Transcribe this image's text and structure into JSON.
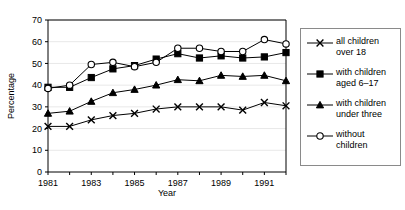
{
  "chart_data": {
    "type": "line",
    "title": "",
    "xlabel": "Year",
    "ylabel": "Percentage",
    "x": [
      1981,
      1982,
      1983,
      1984,
      1985,
      1986,
      1987,
      1988,
      1989,
      1990,
      1991,
      1992
    ],
    "xticklabels": [
      "1981",
      "",
      "1983",
      "",
      "1985",
      "",
      "1987",
      "",
      "1989",
      "",
      "1991",
      ""
    ],
    "yticks": [
      0,
      10,
      20,
      30,
      40,
      50,
      60,
      70
    ],
    "yticklabels": [
      "0",
      "10",
      "20",
      "30",
      "40",
      "50",
      "60",
      "70"
    ],
    "xlim": [
      1981,
      1992
    ],
    "ylim": [
      0,
      70
    ],
    "grid": false,
    "legend_position": "right-outside",
    "series": [
      {
        "name": "all children over 18",
        "marker": "x",
        "values": [
          21,
          21,
          24,
          26,
          27,
          29,
          30,
          30,
          30,
          28.5,
          32,
          30.5
        ]
      },
      {
        "name": "with children aged 6–17",
        "marker": "filled-square",
        "values": [
          39,
          39,
          43.5,
          47.5,
          49,
          52,
          54.5,
          52.5,
          53.5,
          52.5,
          53,
          55
        ]
      },
      {
        "name": "with children under three",
        "marker": "filled-triangle",
        "values": [
          27,
          28,
          32.5,
          36.5,
          38,
          40,
          42.5,
          42,
          44.5,
          44,
          44.5,
          42
        ]
      },
      {
        "name": "without children",
        "marker": "open-circle",
        "values": [
          38.5,
          40,
          49.5,
          50.5,
          48.5,
          50.5,
          57,
          57,
          55.5,
          55.5,
          61,
          59
        ]
      }
    ]
  },
  "legend": {
    "entries": [
      {
        "label": "all children\nover 18",
        "marker": "x"
      },
      {
        "label": "with children\naged 6–17",
        "marker": "filled-square"
      },
      {
        "label": "with children\nunder three",
        "marker": "filled-triangle"
      },
      {
        "label": "without\nchildren",
        "marker": "open-circle"
      }
    ]
  },
  "colors": {
    "ink": "#000000",
    "frame": "#8a8a8a",
    "grid": "#e8e8e8"
  }
}
